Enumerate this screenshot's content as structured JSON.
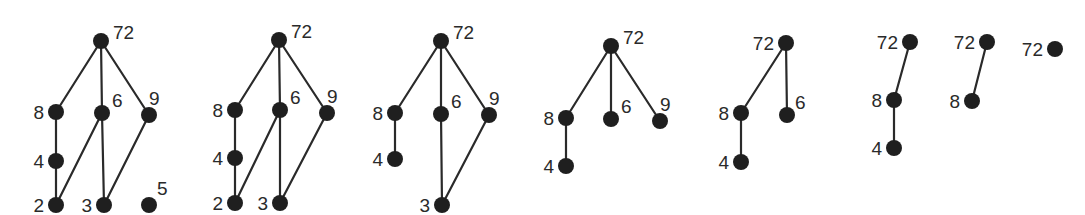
{
  "diagrams": [
    {
      "id": "d1",
      "nodes": [
        {
          "label": "72",
          "x": 101,
          "y": 41,
          "lx": 12,
          "ly": -2,
          "anchor": "start"
        },
        {
          "label": "8",
          "x": 56,
          "y": 112,
          "lx": -12,
          "ly": 7,
          "anchor": "end"
        },
        {
          "label": "6",
          "x": 102,
          "y": 113,
          "lx": 10,
          "ly": -6,
          "anchor": "start"
        },
        {
          "label": "9",
          "x": 149,
          "y": 115,
          "lx": 0,
          "ly": -10,
          "anchor": "start"
        },
        {
          "label": "4",
          "x": 56,
          "y": 161,
          "lx": -12,
          "ly": 7,
          "anchor": "end"
        },
        {
          "label": "2",
          "x": 56,
          "y": 205,
          "lx": -12,
          "ly": 7,
          "anchor": "end"
        },
        {
          "label": "3",
          "x": 104,
          "y": 205,
          "lx": -12,
          "ly": 7,
          "anchor": "end"
        },
        {
          "label": "5",
          "x": 149,
          "y": 205,
          "lx": 8,
          "ly": -10,
          "anchor": "start"
        }
      ],
      "edges": [
        [
          "72",
          "8"
        ],
        [
          "72",
          "6"
        ],
        [
          "72",
          "9"
        ],
        [
          "8",
          "4"
        ],
        [
          "4",
          "2"
        ],
        [
          "6",
          "2"
        ],
        [
          "6",
          "3"
        ],
        [
          "9",
          "3"
        ]
      ]
    },
    {
      "id": "d2",
      "nodes": [
        {
          "label": "72",
          "x": 279,
          "y": 40,
          "lx": 12,
          "ly": -2,
          "anchor": "start"
        },
        {
          "label": "8",
          "x": 235,
          "y": 110,
          "lx": -12,
          "ly": 7,
          "anchor": "end"
        },
        {
          "label": "6",
          "x": 280,
          "y": 110,
          "lx": 10,
          "ly": -6,
          "anchor": "start"
        },
        {
          "label": "9",
          "x": 327,
          "y": 113,
          "lx": 0,
          "ly": -10,
          "anchor": "start"
        },
        {
          "label": "4",
          "x": 235,
          "y": 158,
          "lx": -12,
          "ly": 7,
          "anchor": "end"
        },
        {
          "label": "2",
          "x": 235,
          "y": 203,
          "lx": -12,
          "ly": 7,
          "anchor": "end"
        },
        {
          "label": "3",
          "x": 280,
          "y": 203,
          "lx": -12,
          "ly": 7,
          "anchor": "end"
        }
      ],
      "edges": [
        [
          "72",
          "8"
        ],
        [
          "72",
          "6"
        ],
        [
          "72",
          "9"
        ],
        [
          "8",
          "4"
        ],
        [
          "4",
          "2"
        ],
        [
          "6",
          "2"
        ],
        [
          "6",
          "3"
        ],
        [
          "9",
          "3"
        ]
      ]
    },
    {
      "id": "d3",
      "nodes": [
        {
          "label": "72",
          "x": 441,
          "y": 41,
          "lx": 12,
          "ly": -2,
          "anchor": "start"
        },
        {
          "label": "8",
          "x": 395,
          "y": 113,
          "lx": -12,
          "ly": 7,
          "anchor": "end"
        },
        {
          "label": "6",
          "x": 441,
          "y": 114,
          "lx": 10,
          "ly": -6,
          "anchor": "start"
        },
        {
          "label": "9",
          "x": 489,
          "y": 115,
          "lx": 0,
          "ly": -10,
          "anchor": "start"
        },
        {
          "label": "4",
          "x": 395,
          "y": 159,
          "lx": -12,
          "ly": 7,
          "anchor": "end"
        },
        {
          "label": "3",
          "x": 442,
          "y": 205,
          "lx": -12,
          "ly": 7,
          "anchor": "end"
        }
      ],
      "edges": [
        [
          "72",
          "8"
        ],
        [
          "72",
          "6"
        ],
        [
          "72",
          "9"
        ],
        [
          "8",
          "4"
        ],
        [
          "6",
          "3"
        ],
        [
          "9",
          "3"
        ]
      ]
    },
    {
      "id": "d4",
      "nodes": [
        {
          "label": "72",
          "x": 611,
          "y": 46,
          "lx": 12,
          "ly": -2,
          "anchor": "start"
        },
        {
          "label": "8",
          "x": 566,
          "y": 118,
          "lx": -12,
          "ly": 7,
          "anchor": "end"
        },
        {
          "label": "6",
          "x": 611,
          "y": 119,
          "lx": 10,
          "ly": -6,
          "anchor": "start"
        },
        {
          "label": "9",
          "x": 660,
          "y": 121,
          "lx": 0,
          "ly": -10,
          "anchor": "start"
        },
        {
          "label": "4",
          "x": 566,
          "y": 166,
          "lx": -12,
          "ly": 7,
          "anchor": "end"
        }
      ],
      "edges": [
        [
          "72",
          "8"
        ],
        [
          "72",
          "6"
        ],
        [
          "72",
          "9"
        ],
        [
          "8",
          "4"
        ]
      ]
    },
    {
      "id": "d5",
      "nodes": [
        {
          "label": "72",
          "x": 786,
          "y": 43,
          "lx": -12,
          "ly": 7,
          "anchor": "end"
        },
        {
          "label": "8",
          "x": 741,
          "y": 113,
          "lx": -12,
          "ly": 7,
          "anchor": "end"
        },
        {
          "label": "6",
          "x": 787,
          "y": 115,
          "lx": 8,
          "ly": -6,
          "anchor": "start"
        },
        {
          "label": "4",
          "x": 741,
          "y": 162,
          "lx": -12,
          "ly": 7,
          "anchor": "end"
        }
      ],
      "edges": [
        [
          "72",
          "8"
        ],
        [
          "72",
          "6"
        ],
        [
          "8",
          "4"
        ]
      ]
    },
    {
      "id": "d6",
      "nodes": [
        {
          "label": "72",
          "x": 910,
          "y": 42,
          "lx": -12,
          "ly": 7,
          "anchor": "end"
        },
        {
          "label": "8",
          "x": 894,
          "y": 100,
          "lx": -12,
          "ly": 7,
          "anchor": "end"
        },
        {
          "label": "4",
          "x": 894,
          "y": 148,
          "lx": -12,
          "ly": 7,
          "anchor": "end"
        }
      ],
      "edges": [
        [
          "72",
          "8"
        ],
        [
          "8",
          "4"
        ]
      ]
    },
    {
      "id": "d7",
      "nodes": [
        {
          "label": "72",
          "x": 987,
          "y": 42,
          "lx": -12,
          "ly": 7,
          "anchor": "end"
        },
        {
          "label": "8",
          "x": 972,
          "y": 101,
          "lx": -12,
          "ly": 7,
          "anchor": "end"
        }
      ],
      "edges": [
        [
          "72",
          "8"
        ]
      ]
    },
    {
      "id": "d8",
      "nodes": [
        {
          "label": "72",
          "x": 1055,
          "y": 49,
          "lx": -12,
          "ly": 7,
          "anchor": "end"
        }
      ],
      "edges": []
    }
  ],
  "style": {
    "node_color": "#1f1f1f",
    "edge_color": "#2a2a2a",
    "label_color": "#2a2a2a",
    "node_radius": 8
  }
}
